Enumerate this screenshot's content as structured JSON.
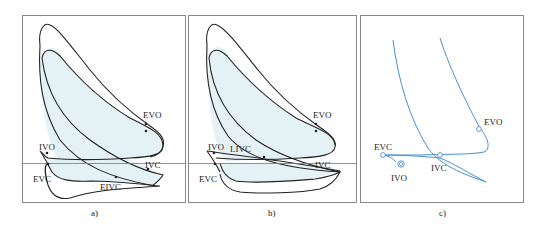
{
  "figure": {
    "panels": [
      {
        "caption": "a)",
        "labels": {
          "evo": "EVO",
          "ivo": "IVO",
          "ivc": "IVC",
          "evc": "EVC",
          "eivc": "EIVC"
        }
      },
      {
        "caption": "b)",
        "labels": {
          "evo": "EVO",
          "ivo": "IVO",
          "livc": "LIVC",
          "ivc": "IVC",
          "evc": "EVC"
        }
      },
      {
        "caption": "c)",
        "labels": {
          "evo": "EVO",
          "evc": "EVC",
          "ivo": "IVO",
          "ivc": "IVC"
        }
      }
    ],
    "colors": {
      "frame": "#8a8a8a",
      "curve": "#222222",
      "fill": "#e4f2f5",
      "blue_curve": "#4a8fd0",
      "baseline": "#777777"
    }
  }
}
